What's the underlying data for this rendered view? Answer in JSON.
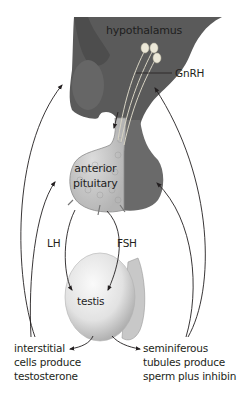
{
  "diagram": {
    "type": "hormonal-feedback-diagram",
    "colors": {
      "hypothalamus_fill": "#5a5a5a",
      "hypothalamus_shadow": "#474747",
      "pituitary_posterior": "#6a6a6a",
      "pituitary_anterior": "#c9c9c9",
      "testis_fill": "#e6e6e6",
      "arrow": "#231f20",
      "neuron": "#e8e4d6"
    },
    "labels": {
      "hypothalamus": "hypothalamus",
      "gnrh": "GnRH",
      "anterior_pituitary": "anterior\npituitary",
      "lh": "LH",
      "fsh": "FSH",
      "testis": "testis",
      "interstitial": "interstitial\ncells produce\ntestosterone",
      "seminiferous": "seminiferous\ntubules produce\nsperm plus inhibin"
    },
    "nodes": [
      {
        "id": "hypothalamus",
        "label": "hypothalamus"
      },
      {
        "id": "anterior-pituitary",
        "label": "anterior pituitary"
      },
      {
        "id": "testis",
        "label": "testis"
      },
      {
        "id": "interstitial-cells",
        "label": "interstitial cells produce testosterone"
      },
      {
        "id": "seminiferous-tubules",
        "label": "seminiferous tubules produce sperm plus inhibin"
      }
    ],
    "edges": [
      {
        "from": "hypothalamus",
        "to": "anterior-pituitary",
        "label": "GnRH"
      },
      {
        "from": "anterior-pituitary",
        "to": "testis",
        "label": "LH"
      },
      {
        "from": "anterior-pituitary",
        "to": "testis",
        "label": "FSH"
      },
      {
        "from": "testis",
        "to": "interstitial-cells",
        "label": ""
      },
      {
        "from": "testis",
        "to": "seminiferous-tubules",
        "label": ""
      },
      {
        "from": "interstitial-cells",
        "to": "hypothalamus",
        "label": "negative feedback"
      },
      {
        "from": "interstitial-cells",
        "to": "anterior-pituitary",
        "label": "negative feedback"
      },
      {
        "from": "seminiferous-tubules",
        "to": "hypothalamus",
        "label": "negative feedback"
      },
      {
        "from": "seminiferous-tubules",
        "to": "anterior-pituitary",
        "label": "negative feedback"
      }
    ]
  }
}
